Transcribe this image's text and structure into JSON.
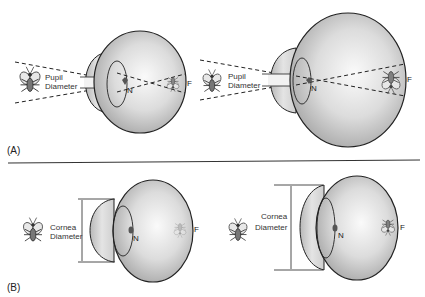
{
  "figure": {
    "panels": [
      {
        "id": "A",
        "label": "(A)",
        "eyes": [
          {
            "size": "small",
            "measure_label_line1": "Pupil",
            "measure_label_line2": "Diameter",
            "nodal_label": "N",
            "focal_label": "F"
          },
          {
            "size": "large",
            "measure_label_line1": "Pupil",
            "measure_label_line2": "Diameter",
            "nodal_label": "N",
            "focal_label": "F"
          }
        ]
      },
      {
        "id": "B",
        "label": "(B)",
        "eyes": [
          {
            "size": "small",
            "measure_label_line1": "Cornea",
            "measure_label_line2": "Diameter",
            "nodal_label": "N",
            "focal_label": "F"
          },
          {
            "size": "large",
            "measure_label_line1": "Cornea",
            "measure_label_line2": "Diameter",
            "nodal_label": "N",
            "focal_label": "F"
          }
        ]
      }
    ],
    "colors": {
      "eye_fill_light": "#f4f4f4",
      "eye_fill_dark": "#a9a9a9",
      "outline": "#222222",
      "nodal_point": "#555555"
    }
  }
}
